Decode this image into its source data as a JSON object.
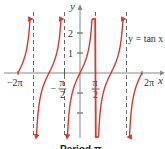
{
  "chart_data": {
    "type": "line",
    "title": "",
    "function_label": "y = tan x",
    "xlabel": "x",
    "ylabel": "y",
    "xlim": [
      -7.0,
      7.4
    ],
    "ylim": [
      -4.6,
      3.6
    ],
    "x_ticks": [
      {
        "value": -6.2832,
        "label": "−2π"
      },
      {
        "value": -1.5708,
        "label_num": "π",
        "label_den": "2",
        "sign": "−"
      },
      {
        "value": 1.5708,
        "label_num": "π",
        "label_den": "2",
        "sign": ""
      },
      {
        "value": 6.2832,
        "label": "2π"
      }
    ],
    "y_ticks": [
      {
        "value": 2,
        "label": "2"
      },
      {
        "value": 1,
        "label": "1"
      },
      {
        "value": -1,
        "label": ""
      },
      {
        "value": -2,
        "label": ""
      }
    ],
    "asymptotes": [
      -4.7124,
      -1.5708,
      1.5708,
      4.7124
    ],
    "branches": [
      {
        "from": -6.2832,
        "to": -4.98
      },
      {
        "from": -4.44,
        "to": -1.84
      },
      {
        "from": -1.3,
        "to": 1.84
      },
      {
        "from": 1.3,
        "to": 4.44
      },
      {
        "from": 4.98,
        "to": 6.2832
      }
    ],
    "curve_color": "#d9392b",
    "asymptote_color": "#666666",
    "axis_color": "#888888",
    "caption": "Period π"
  }
}
